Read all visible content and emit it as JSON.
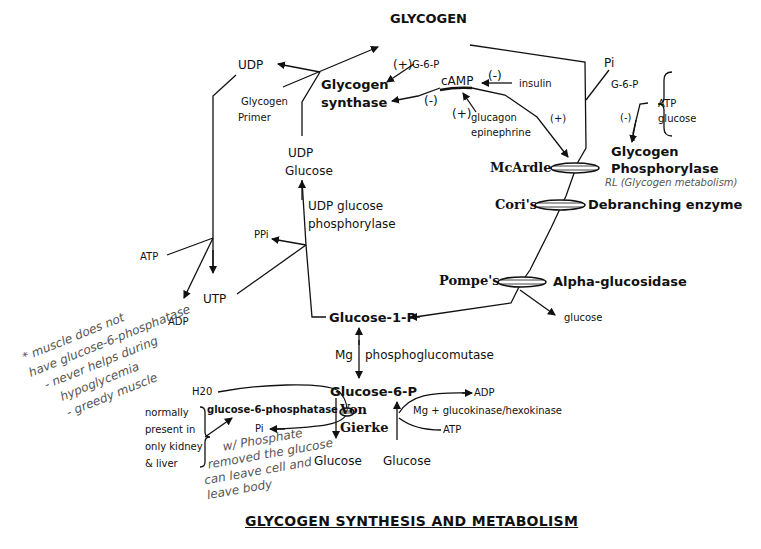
{
  "title": "GLYCOGEN SYNTHESIS AND METABOLISM",
  "nodes": {
    "glycogen": "GLYCOGEN",
    "udp_top": "UDP",
    "glycogen_synthase_1": "Glycogen",
    "glycogen_synthase_2": "synthase",
    "glycogen_primer_1": "Glycogen",
    "glycogen_primer_2": "Primer",
    "udp_glucose_1": "UDP",
    "udp_glucose_2": "Glucose",
    "udp_glucose_phosphorylase_1": "UDP glucose",
    "udp_glucose_phosphorylase_2": "phosphorylase",
    "ppi": "PPi",
    "atp_left": "ATP",
    "adp_left": "ADP",
    "utp": "UTP",
    "glucose_1_p": "Glucose-1-P",
    "mg": "Mg",
    "phosphoglucomutase": "phosphoglucomutase",
    "glucose_6_p": "Glucose-6-P",
    "h2o": "H20",
    "glucose_6_phosphatase": "glucose-6-phosphatase",
    "pi_bottom": "Pi",
    "glucose_bottom_left": "Glucose",
    "glucose_bottom_right": "Glucose",
    "adp_right": "ADP",
    "atp_right": "ATP",
    "glucokinase": "Mg  +  glucokinase/hexokinase",
    "camp": "cAMP",
    "insulin": "insulin",
    "glucagon": "glucagon",
    "epinephrine": "epinephrine",
    "g6p_top": "G-6-P",
    "pi_top": "Pi",
    "g6p_right": "G-6-P",
    "atp_brace": "ATP",
    "glucose_brace": "glucose",
    "glycogen_phosphorylase_1": "Glycogen",
    "glycogen_phosphorylase_2": "Phosphorylase",
    "debranching_enzyme": "Debranching enzyme",
    "alpha_glucosidase": "Alpha-glucosidase",
    "glucose_pompe": "glucose"
  },
  "signs": {
    "plus_g6p": "(+)",
    "minus_insulin": "(-)",
    "minus_camp": "(-)",
    "plus_glucagon": "(+)",
    "plus_phosphorylase": "(+)",
    "minus_brace": "(-)"
  },
  "diseases": {
    "mcardle": "McArdle",
    "cori": "Cori's",
    "pompe": "Pompe's",
    "von_gierke_1": "Von",
    "von_gierke_2": "Gierke"
  },
  "notes": {
    "normally_1": "normally",
    "normally_2": "present in",
    "normally_3": "only kidney",
    "normally_4": "& liver"
  },
  "handwritten": {
    "rl": "RL (Glycogen metabolism)",
    "muscle_1": "* muscle does not",
    "muscle_2": "have glucose-6-phosphatase",
    "muscle_3": "- never helps during",
    "muscle_4": "hypoglycemia",
    "muscle_5": "- greedy muscle",
    "phosphate_1": "w/ Phosphate",
    "phosphate_2": "removed the glucose",
    "phosphate_3": "can leave cell and",
    "phosphate_4": "leave body"
  }
}
